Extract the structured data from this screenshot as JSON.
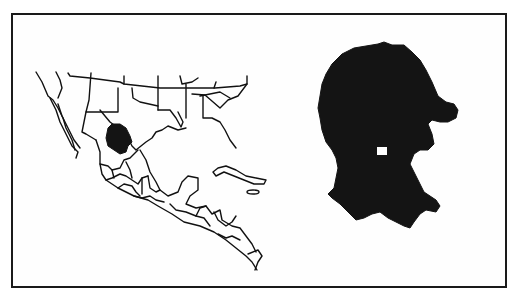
{
  "figure": {
    "type": "locator-map",
    "panels": [
      {
        "id": "overview",
        "description": "Outline map of southern United States, Mexico, Central America and the Caribbean with state/country borders; one Mexican state highlighted",
        "highlight_color": "#141414",
        "outline_color": "#111111"
      },
      {
        "id": "detail",
        "description": "Enlarged silhouette of the highlighted Mexican state with a small white square marker",
        "fill_color": "#141414",
        "marker": "white-square"
      }
    ],
    "frame_color": "#1a1a1a",
    "background": "#ffffff"
  }
}
